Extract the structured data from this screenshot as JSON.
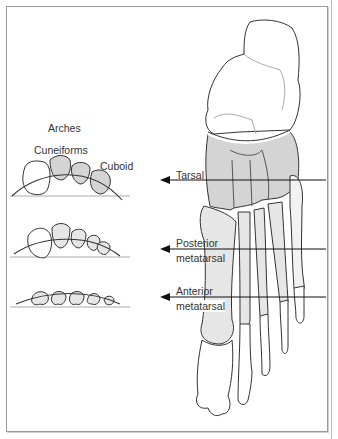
{
  "figure": {
    "heading": "Arches",
    "arch_labels": {
      "cuneiforms": "Cuneiforms",
      "cuboid": "Cuboid"
    },
    "section_labels": [
      {
        "line1": "Tarsal",
        "line2": ""
      },
      {
        "line1": "Posterior",
        "line2": "metatarsal"
      },
      {
        "line1": "Anterior",
        "line2": "metatarsal"
      }
    ],
    "colors": {
      "bone_fill": "#ffffff",
      "shaded_bone": "#d4d4d4",
      "light_shade": "#e6e6e6",
      "outline": "#333333",
      "frame": "#9a9a9a"
    }
  }
}
